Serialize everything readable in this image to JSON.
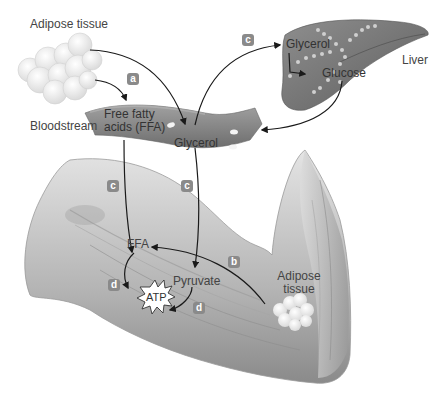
{
  "diagram": {
    "labels": {
      "adipose_top": "Adipose tissue",
      "bloodstream": "Bloodstream",
      "ffa_blood_line1": "Free fatty",
      "ffa_blood_line2": "acids (FFA)",
      "glycerol_blood": "Glycerol",
      "liver": "Liver",
      "glycerol_liver": "Glycerol",
      "glucose_liver": "Glucose",
      "ffa_muscle": "FFA",
      "pyruvate": "Pyruvate",
      "atp": "ATP",
      "adipose_arm_line1": "Adipose",
      "adipose_arm_line2": "tissue"
    },
    "badges": {
      "a": "a",
      "b": "b",
      "c_liver": "c",
      "c_ffa": "c",
      "c_glycerol": "c",
      "d_ffa": "d",
      "d_pyruvate": "d"
    },
    "colors": {
      "badge": "#8a8a8a",
      "arrow": "#1a1a1a",
      "tissue_fill": "#f2f2f2",
      "vessel_fill": "#8c8c8c",
      "liver_fill": "#7a7a7a",
      "arm_fill": "#c8c8c8"
    }
  }
}
